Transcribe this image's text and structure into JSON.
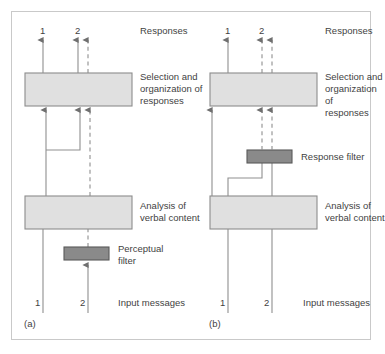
{
  "figure": {
    "background_color": "#ffffff",
    "frame_color": "#c9c9c9",
    "process_box_fill": "#e0e0e0",
    "process_box_stroke": "#8c8c8c",
    "filter_box_fill": "#8a8a8a",
    "filter_box_stroke": "#5a5a5a",
    "line_color": "#8f8f8f",
    "text_color": "#3f3f3f"
  },
  "panels": [
    {
      "id": "panel-a",
      "caption": "(a)",
      "top_axis_label": "Responses",
      "bottom_axis_label": "Input messages",
      "top_channel_numbers": [
        "1",
        "2"
      ],
      "bottom_channel_numbers": [
        "1",
        "2"
      ],
      "boxes": [
        {
          "id": "selection-box-a",
          "label": "Selection and\norganization of\nresponses",
          "type": "process",
          "fill": "#e0e0e0"
        },
        {
          "id": "analysis-box-a",
          "label": "Analysis of\nverbal content",
          "type": "process",
          "fill": "#e0e0e0"
        },
        {
          "id": "perceptual-filter-a",
          "label": "Perceptual\nfilter",
          "type": "filter",
          "fill": "#8a8a8a"
        }
      ]
    },
    {
      "id": "panel-b",
      "caption": "(b)",
      "top_axis_label": "Responses",
      "bottom_axis_label": "Input messages",
      "top_channel_numbers": [
        "1",
        "2"
      ],
      "bottom_channel_numbers": [
        "1",
        "2"
      ],
      "boxes": [
        {
          "id": "selection-box-b",
          "label": "Selection and\norganization of\nresponses",
          "type": "process",
          "fill": "#e0e0e0"
        },
        {
          "id": "response-filter-b",
          "label": "Response filter",
          "type": "filter",
          "fill": "#8a8a8a"
        },
        {
          "id": "analysis-box-b",
          "label": "Analysis of\nverbal content",
          "type": "process",
          "fill": "#e0e0e0"
        }
      ]
    }
  ],
  "labels": {
    "responses_a": "Responses",
    "selection_a": "Selection and\norganization of\nresponses",
    "analysis_a": "Analysis of\nverbal content",
    "perceptual_filter_a": "Perceptual\nfilter",
    "input_messages_a": "Input messages",
    "caption_a": "(a)",
    "top_num_a_1": "1",
    "top_num_a_2": "2",
    "bottom_num_a_1": "1",
    "bottom_num_a_2": "2",
    "responses_b": "Responses",
    "selection_b": "Selection and\norganization of\nresponses",
    "response_filter_b": "Response filter",
    "analysis_b": "Analysis of\nverbal content",
    "input_messages_b": "Input messages",
    "caption_b": "(b)",
    "top_num_b_1": "1",
    "top_num_b_2": "2",
    "bottom_num_b_1": "1",
    "bottom_num_b_2": "2"
  }
}
